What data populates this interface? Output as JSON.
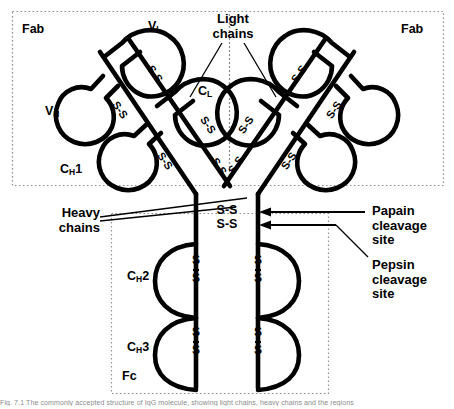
{
  "figure": {
    "width": 454,
    "height": 409,
    "background_color": "#ffffff",
    "ink_color": "#000000",
    "dotted_color": "#9a9a9a"
  },
  "regions": {
    "fab_left_label": "Fab",
    "fab_right_label": "Fab",
    "fc_label": "Fc"
  },
  "domains": {
    "v_l": {
      "base": "V",
      "sub": "L"
    },
    "v_h": {
      "base": "V",
      "sub": "H"
    },
    "c_l": {
      "base": "C",
      "sub": "L"
    },
    "c_h1": {
      "base": "C",
      "sub": "H",
      "suffix": "1"
    },
    "c_h2": {
      "base": "C",
      "sub": "H",
      "suffix": "2"
    },
    "c_h3": {
      "base": "C",
      "sub": "H",
      "suffix": "3"
    }
  },
  "callouts": {
    "light_chains": "Light\nchains",
    "heavy_chains": "Heavy\nchains",
    "papain": "Papain\ncleavage\nsite",
    "pepsin": "Pepsin\ncleavage\nsite"
  },
  "bonds": {
    "label": "S-S",
    "vertical_label_top": "S",
    "vertical_label_bottom": "S",
    "hinge_count": 2,
    "fc_count": 4,
    "fab_count": 8
  },
  "caption": {
    "text": "Fig. 7.1  The commonly accepted structure of IgG molecule, showing light chains, heavy chains and the regions"
  }
}
